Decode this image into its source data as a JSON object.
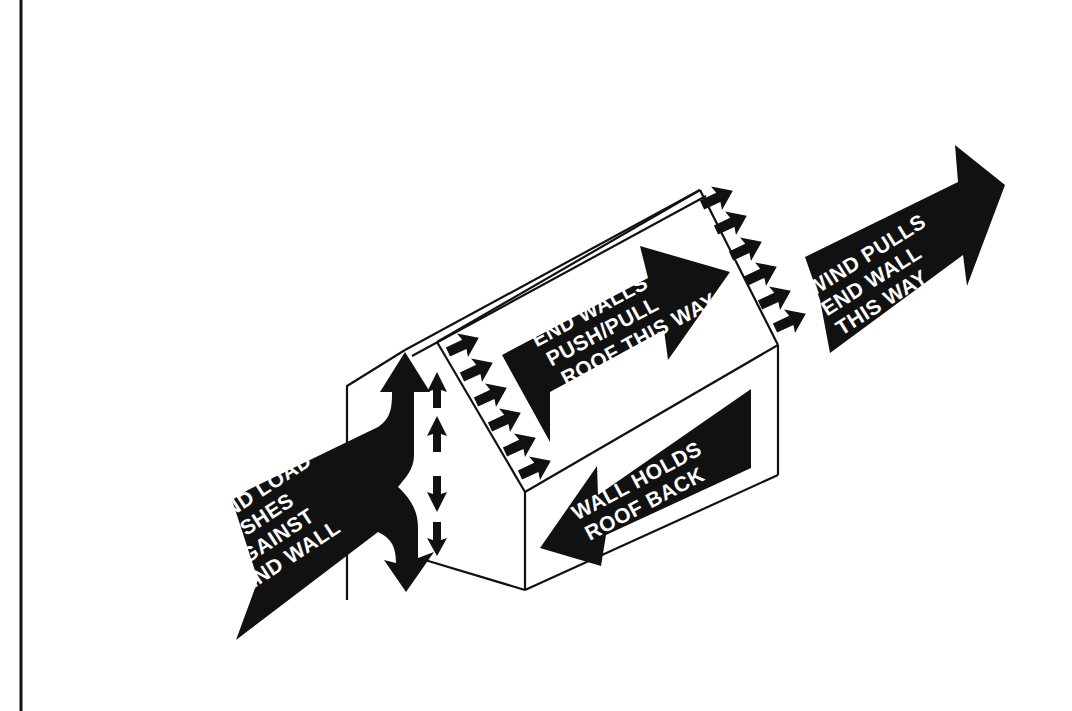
{
  "diagram": {
    "colors": {
      "background": "#ffffff",
      "ink": "#111111",
      "label_text": "#ffffff"
    },
    "labels": {
      "wind_load": [
        "WIND LOAD",
        "PUSHES",
        "AGAINST",
        "END WALL"
      ],
      "end_walls": [
        "END WALLS",
        "PUSH/PULL",
        "ROOF THIS WAY"
      ],
      "wall_holds": [
        "WALL HOLDS",
        "ROOF BACK"
      ],
      "wind_pulls": [
        "WIND PULLS",
        "END WALL",
        "THIS WAY"
      ]
    },
    "elements": [
      {
        "name": "house-outline",
        "description": "Isometric gable house"
      },
      {
        "name": "wind-load-arrow",
        "description": "Large arrow from lower-left splitting up and down at end wall"
      },
      {
        "name": "vertical-force-arrows",
        "description": "Dashed vertical arrows along front end wall, up top, down bottom"
      },
      {
        "name": "front-gable-push-arrows",
        "description": "Six small arrows on front gable edge pointing right"
      },
      {
        "name": "back-gable-pull-arrows",
        "description": "Six small arrows on back gable edge pointing right"
      },
      {
        "name": "end-walls-arrow",
        "description": "Arrow on roof pointing toward back"
      },
      {
        "name": "wall-holds-arrow",
        "description": "Arrow on side wall pointing toward front"
      },
      {
        "name": "wind-pulls-arrow",
        "description": "Large arrow on right pointing away"
      }
    ]
  }
}
